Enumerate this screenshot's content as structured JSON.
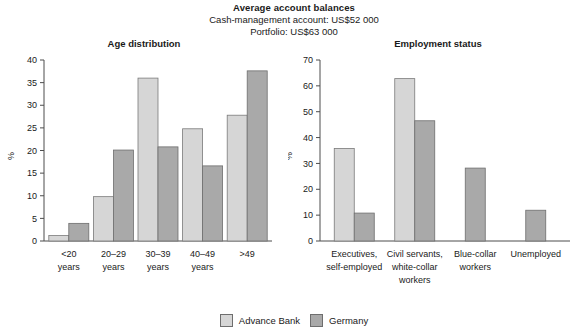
{
  "header": {
    "title": "Average account balances",
    "subtitle_1": "Cash-management account: US$52 000",
    "subtitle_2": "Portfolio: US$63 000"
  },
  "legend": {
    "items": [
      {
        "label": "Advance Bank",
        "color": "#d6d6d6",
        "swatch": "legend-swatch-light"
      },
      {
        "label": "Germany",
        "color": "#a9a9a9",
        "swatch": "legend-swatch-dark"
      }
    ]
  },
  "chart_data": [
    {
      "type": "bar",
      "title": "Age distribution",
      "xlabel": "",
      "ylabel": "%",
      "ylim": [
        0,
        40
      ],
      "yticks": [
        0,
        5,
        10,
        15,
        20,
        25,
        30,
        35,
        40
      ],
      "grid": false,
      "legend_position": "bottom-center",
      "categories": [
        "<20\nyears",
        "20–29\nyears",
        "30–39\nyears",
        "40–49\nyears",
        ">49"
      ],
      "category_lines": [
        [
          "<20",
          "years"
        ],
        [
          "20–29",
          "years"
        ],
        [
          "30–39",
          "years"
        ],
        [
          "40–49",
          "years"
        ],
        [
          ">49",
          ""
        ]
      ],
      "series": [
        {
          "name": "Advance Bank",
          "color": "#d6d6d6",
          "values": [
            1.2,
            9.8,
            36.0,
            24.8,
            27.8
          ]
        },
        {
          "name": "Germany",
          "color": "#a9a9a9",
          "values": [
            3.9,
            20.1,
            20.8,
            16.6,
            37.6
          ]
        }
      ]
    },
    {
      "type": "bar",
      "title": "Employment status",
      "xlabel": "",
      "ylabel": "%",
      "ylim": [
        0,
        70
      ],
      "yticks": [
        0,
        10,
        20,
        30,
        40,
        50,
        60,
        70
      ],
      "grid": false,
      "legend_position": "bottom-center",
      "categories": [
        "Executives,\nself-employed",
        "Civil servants,\nwhite-collar\nworkers",
        "Blue-collar\nworkers",
        "Unemployed"
      ],
      "category_lines": [
        [
          "Executives,",
          "self-employed",
          ""
        ],
        [
          "Civil servants,",
          "white-collar",
          "workers"
        ],
        [
          "Blue-collar",
          "workers",
          ""
        ],
        [
          "Unemployed",
          "",
          ""
        ]
      ],
      "series": [
        {
          "name": "Advance Bank",
          "color": "#d6d6d6",
          "values": [
            35.8,
            62.8,
            null,
            null
          ]
        },
        {
          "name": "Germany",
          "color": "#a9a9a9",
          "values": [
            10.8,
            46.5,
            28.2,
            11.9
          ]
        }
      ]
    }
  ]
}
